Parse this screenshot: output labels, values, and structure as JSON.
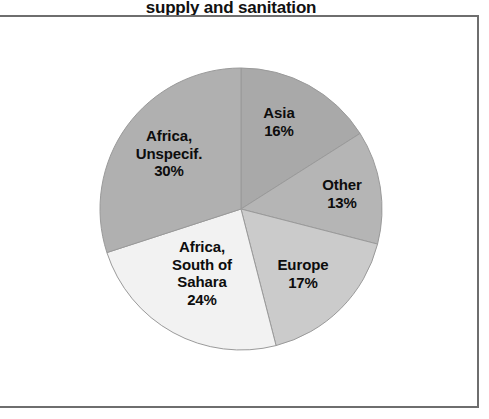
{
  "title": "supply and sanitation",
  "chart_data": {
    "type": "pie",
    "title": "supply and sanitation",
    "xlabel": "",
    "ylabel": "",
    "legend": "none (labels drawn on slices)",
    "start_angle_deg": 0,
    "direction": "clockwise",
    "labels": [
      "Asia",
      "Other",
      "Europe",
      "Africa, South of Sahara",
      "Africa, Unspecif."
    ],
    "values": [
      16,
      13,
      17,
      24,
      30
    ],
    "units": "percent",
    "colors": [
      "#a9a9a9",
      "#b5b5b5",
      "#cbcbcb",
      "#f2f2f2",
      "#b0b0b0"
    ],
    "slices": [
      {
        "name": "Asia",
        "label_text": "Asia\n16%",
        "value": 16,
        "value_text": "16%",
        "color": "#a9a9a9"
      },
      {
        "name": "Other",
        "label_text": "Other\n13%",
        "value": 13,
        "value_text": "13%",
        "color": "#b5b5b5"
      },
      {
        "name": "Europe",
        "label_text": "Europe\n17%",
        "value": 17,
        "value_text": "17%",
        "color": "#cbcbcb"
      },
      {
        "name": "Africa, South of Sahara",
        "label_text": "Africa,\nSouth of\nSahara\n24%",
        "value": 24,
        "value_text": "24%",
        "color": "#f2f2f2"
      },
      {
        "name": "Africa, Unspecif.",
        "label_text": "Africa,\nUnspecif.\n30%",
        "value": 30,
        "value_text": "30%",
        "color": "#b0b0b0"
      }
    ]
  },
  "frame": {
    "line_color": "#6e6e6e"
  }
}
